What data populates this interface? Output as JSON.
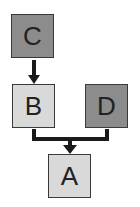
{
  "diagram": {
    "nodes": [
      {
        "id": "C",
        "label": "C",
        "shade": "dark"
      },
      {
        "id": "B",
        "label": "B",
        "shade": "light"
      },
      {
        "id": "D",
        "label": "D",
        "shade": "dark"
      },
      {
        "id": "A",
        "label": "A",
        "shade": "light"
      }
    ],
    "edges": [
      {
        "from": "C",
        "to": "B"
      },
      {
        "from": "B",
        "to": "A"
      },
      {
        "from": "D",
        "to": "A"
      }
    ],
    "colors": {
      "dark_fill": "#8c8c8c",
      "light_fill": "#d9d9d9",
      "border": "#3a3a3a",
      "connector": "#1a1a1a"
    }
  }
}
